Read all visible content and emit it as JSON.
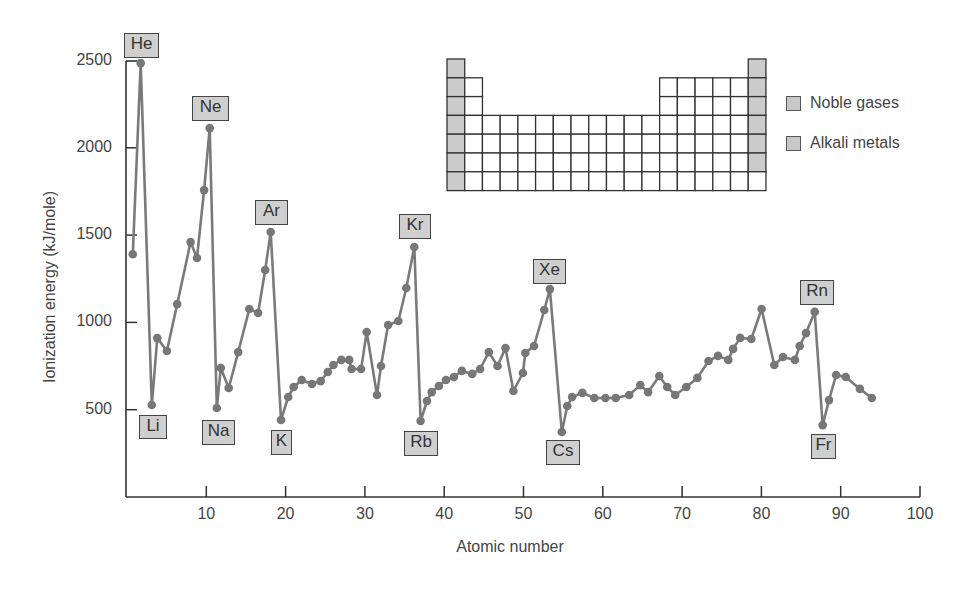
{
  "chart_data": {
    "type": "line",
    "title": "",
    "xlabel": "Atomic number",
    "ylabel": "Ionization energy (kJ/mole)",
    "xlim": [
      0,
      100
    ],
    "ylim": [
      0,
      2500
    ],
    "grid": false,
    "x_ticks": [
      10,
      20,
      30,
      40,
      50,
      60,
      70,
      80,
      90,
      100
    ],
    "y_ticks": [
      500,
      1000,
      1500,
      2000,
      2500
    ],
    "legend_position": "upper right (beside periodic-table inset)",
    "legend": [
      {
        "label": "Noble gases",
        "color": "#c8c8c8"
      },
      {
        "label": "Alkali metals",
        "color": "#c8c8c8"
      }
    ],
    "series": [
      {
        "name": "First ionization energy",
        "color": "#777777",
        "points": [
          [
            0.6,
            1390
          ],
          [
            1.6,
            2485
          ],
          [
            3.0,
            527
          ],
          [
            3.7,
            910
          ],
          [
            4.9,
            836
          ],
          [
            6.2,
            1105
          ],
          [
            7.9,
            1460
          ],
          [
            8.7,
            1369
          ],
          [
            9.6,
            1758
          ],
          [
            10.3,
            2113
          ],
          [
            11.2,
            510
          ],
          [
            11.7,
            739
          ],
          [
            12.7,
            624
          ],
          [
            13.9,
            830
          ],
          [
            15.3,
            1077
          ],
          [
            16.4,
            1054
          ],
          [
            17.3,
            1300
          ],
          [
            18.0,
            1518
          ],
          [
            19.3,
            441
          ],
          [
            20.2,
            573
          ],
          [
            20.9,
            630
          ],
          [
            21.9,
            670
          ],
          [
            23.2,
            647
          ],
          [
            24.3,
            664
          ],
          [
            25.2,
            716
          ],
          [
            25.9,
            756
          ],
          [
            26.9,
            785
          ],
          [
            27.9,
            785
          ],
          [
            28.2,
            733
          ],
          [
            29.4,
            733
          ],
          [
            30.1,
            945
          ],
          [
            31.4,
            584
          ],
          [
            31.9,
            750
          ],
          [
            32.8,
            985
          ],
          [
            34.1,
            1008
          ],
          [
            35.1,
            1197
          ],
          [
            36.1,
            1432
          ],
          [
            36.9,
            435
          ],
          [
            37.7,
            550
          ],
          [
            38.3,
            601
          ],
          [
            39.2,
            636
          ],
          [
            40.1,
            670
          ],
          [
            41.1,
            687
          ],
          [
            42.1,
            722
          ],
          [
            43.4,
            705
          ],
          [
            44.4,
            733
          ],
          [
            45.5,
            830
          ],
          [
            46.6,
            750
          ],
          [
            47.6,
            853
          ],
          [
            48.6,
            607
          ],
          [
            49.8,
            710
          ],
          [
            50.1,
            825
          ],
          [
            51.2,
            865
          ],
          [
            52.5,
            1071
          ],
          [
            53.2,
            1191
          ],
          [
            54.7,
            372
          ],
          [
            55.4,
            521
          ],
          [
            56.0,
            573
          ],
          [
            57.3,
            596
          ],
          [
            58.8,
            567
          ],
          [
            60.2,
            567
          ],
          [
            61.5,
            567
          ],
          [
            63.2,
            584
          ],
          [
            64.6,
            641
          ],
          [
            65.6,
            601
          ],
          [
            67.0,
            693
          ],
          [
            68.0,
            630
          ],
          [
            69.0,
            584
          ],
          [
            70.4,
            630
          ],
          [
            71.8,
            682
          ],
          [
            73.2,
            779
          ],
          [
            74.4,
            808
          ],
          [
            75.7,
            785
          ],
          [
            76.3,
            848
          ],
          [
            77.2,
            911
          ],
          [
            78.6,
            905
          ],
          [
            79.9,
            1077
          ],
          [
            81.5,
            756
          ],
          [
            82.6,
            802
          ],
          [
            84.1,
            785
          ],
          [
            84.7,
            865
          ],
          [
            85.5,
            939
          ],
          [
            86.6,
            1060
          ],
          [
            87.6,
            412
          ],
          [
            88.4,
            555
          ],
          [
            89.3,
            699
          ],
          [
            90.5,
            687
          ],
          [
            92.3,
            619
          ],
          [
            93.8,
            567
          ]
        ]
      }
    ],
    "annotations": [
      {
        "text": "He",
        "element": "noble",
        "x": 1.6,
        "y": 2485
      },
      {
        "text": "Ne",
        "element": "noble",
        "x": 10.3,
        "y": 2113
      },
      {
        "text": "Ar",
        "element": "noble",
        "x": 18.0,
        "y": 1518
      },
      {
        "text": "Kr",
        "element": "noble",
        "x": 36.1,
        "y": 1432
      },
      {
        "text": "Xe",
        "element": "noble",
        "x": 53.2,
        "y": 1191
      },
      {
        "text": "Rn",
        "element": "noble",
        "x": 86.6,
        "y": 1060
      },
      {
        "text": "Li",
        "element": "alkali",
        "x": 3.0,
        "y": 527
      },
      {
        "text": "Na",
        "element": "alkali",
        "x": 11.2,
        "y": 510
      },
      {
        "text": "K",
        "element": "alkali",
        "x": 19.3,
        "y": 441
      },
      {
        "text": "Rb",
        "element": "alkali",
        "x": 36.9,
        "y": 435
      },
      {
        "text": "Cs",
        "element": "alkali",
        "x": 54.7,
        "y": 372
      },
      {
        "text": "Fr",
        "element": "alkali",
        "x": 87.6,
        "y": 412
      }
    ],
    "inset": {
      "type": "periodic-table-outline",
      "columns": 18,
      "rows": 7,
      "shaded_columns": {
        "alkali_group_1_rows": [
          1,
          2,
          3,
          4,
          5,
          6,
          7
        ],
        "noble_group_18_rows": [
          1,
          2,
          3,
          4,
          5,
          6
        ]
      }
    }
  },
  "labels": {
    "he": "He",
    "ne": "Ne",
    "ar": "Ar",
    "kr": "Kr",
    "xe": "Xe",
    "rn": "Rn",
    "li": "Li",
    "na": "Na",
    "k": "K",
    "rb": "Rb",
    "cs": "Cs",
    "fr": "Fr"
  },
  "axes": {
    "x_title": "Atomic number",
    "y_title": "Ionization energy (kJ/mole)",
    "x_ticks": [
      "10",
      "20",
      "30",
      "40",
      "50",
      "60",
      "70",
      "80",
      "90",
      "100"
    ],
    "y_ticks": [
      "2500",
      "2000",
      "1500",
      "1000",
      "500"
    ]
  },
  "legend": {
    "noble": "Noble gases",
    "alkali": "Alkali metals"
  }
}
